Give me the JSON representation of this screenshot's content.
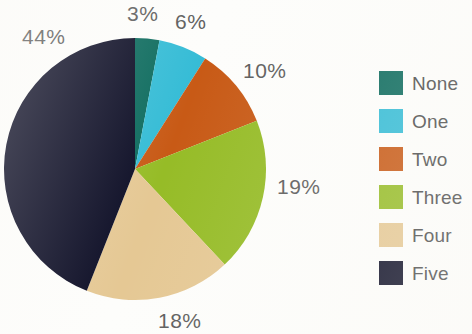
{
  "chart_data": {
    "type": "pie",
    "title": "",
    "subtitle": "",
    "xlabel": "",
    "ylabel": "",
    "grid": false,
    "legend_position": "right",
    "start_angle_deg": 0,
    "direction": "clockwise",
    "center": {
      "x": 135,
      "y": 169
    },
    "radius": 131,
    "categories": [
      "None",
      "One",
      "Two",
      "Three",
      "Four",
      "Five"
    ],
    "values": [
      3,
      6,
      10,
      19,
      18,
      44
    ],
    "value_unit": "%",
    "data_labels": [
      "3%",
      "6%",
      "10%",
      "19%",
      "18%",
      "44%"
    ],
    "colors": [
      "#0d6b5e",
      "#35bcd6",
      "#c85a16",
      "#96bc27",
      "#e5c894",
      "#0d0e26"
    ],
    "slices": [
      {
        "label": "None",
        "value": 3,
        "data_label": "3%",
        "color": "#0d6b5e"
      },
      {
        "label": "One",
        "value": 6,
        "data_label": "6%",
        "color": "#35bcd6"
      },
      {
        "label": "Two",
        "value": 10,
        "data_label": "10%",
        "color": "#c85a16"
      },
      {
        "label": "Three",
        "value": 19,
        "data_label": "19%",
        "color": "#96bc27"
      },
      {
        "label": "Four",
        "value": 18,
        "data_label": "18%",
        "color": "#e5c894"
      },
      {
        "label": "Five",
        "value": 44,
        "data_label": "44%",
        "color": "#0d0e26"
      }
    ]
  },
  "labels": {
    "none_pct": "3%",
    "one_pct": "6%",
    "two_pct": "10%",
    "three_pct": "19%",
    "four_pct": "18%",
    "five_pct": "44%"
  },
  "legend": {
    "items": [
      {
        "label": "None",
        "color": "#0d6b5e"
      },
      {
        "label": "One",
        "color": "#35bcd6"
      },
      {
        "label": "Two",
        "color": "#c85a16"
      },
      {
        "label": "Three",
        "color": "#96bc27"
      },
      {
        "label": "Four",
        "color": "#e5c894"
      },
      {
        "label": "Five",
        "color": "#0d0e26"
      }
    ]
  },
  "style": {
    "label_text_color": "#5d5d5d",
    "legend_text_color": "#4c4c4c",
    "background": "#fdfdfb"
  }
}
